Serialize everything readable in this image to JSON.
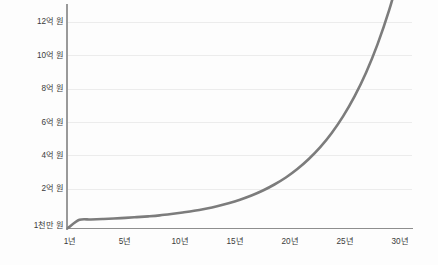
{
  "chart_data": {
    "type": "line",
    "title": "",
    "subtitle": "",
    "xlabel": "",
    "ylabel": "",
    "grid": true,
    "legend": false,
    "legend_position": "none",
    "line_color": "#7c7c7c",
    "gridline_color": "#ececec",
    "axis_color": "#8e8e8e",
    "background_color": "#fdfdfd",
    "x_tick_labels": [
      "1년",
      "5년",
      "10년",
      "15년",
      "20년",
      "25년",
      "30년"
    ],
    "x_tick_values": [
      1,
      5,
      10,
      15,
      20,
      25,
      30
    ],
    "xlim": [
      1,
      31
    ],
    "y_tick_labels": [
      "1천만 원",
      "2억 원",
      "4억 원",
      "6억 원",
      "8억 원",
      "10억 원",
      "12억 원"
    ],
    "y_tick_values": [
      0.1,
      2,
      4,
      6,
      8,
      10,
      12
    ],
    "y_unit": "억 원",
    "ylim": [
      0.1,
      13
    ],
    "series": [
      {
        "name": "복리 성장",
        "x": [
          1,
          2,
          3,
          4,
          5,
          6,
          7,
          8,
          9,
          10,
          11,
          12,
          13,
          14,
          15,
          16,
          17,
          18,
          19,
          20,
          21,
          22,
          23,
          24,
          25,
          26,
          27,
          28,
          29,
          30
        ],
        "values": [
          0.1,
          0.12,
          0.14,
          0.17,
          0.2,
          0.24,
          0.28,
          0.33,
          0.39,
          0.47,
          0.56,
          0.66,
          0.79,
          0.94,
          1.12,
          1.33,
          1.58,
          1.88,
          2.24,
          2.66,
          3.17,
          3.77,
          4.48,
          5.33,
          6.34,
          7.54,
          8.96,
          10.66,
          12.68,
          15.08
        ]
      }
    ]
  },
  "chart": {
    "curve_path": "M 68 228 L 79 227.6 L 90 227.1 L 101 226.4 L 112 225.6 L 123 224.6 L 134 223.4 L 145 221.9 L 156 220.2 L 167 218.0 L 178 215.4 L 189 212.4 L 200 208.7 L 211 204.4 L 222 199.2 L 233 193.1 L 244 185.9 L 255 177.4 L 266 167.4 L 277 155.7 L 288 142.0 L 299 126.1 L 310 107.6 L 321 86.2 L 332 61.5 L 343 33.0",
    "curve_path_render": "M 68 228 C 110 227.5 160 224 200 212 C 240 199 280 176 310 142 C 340 108 375 72 412 60",
    "grid_y_positions": [
      21.8,
      55.2,
      88.5,
      121.8,
      155.2,
      188.5
    ],
    "x_tick_positions": [
      70,
      125,
      180,
      235,
      290,
      345,
      400
    ],
    "y_label_positions": [
      18,
      51.5,
      85,
      118.5,
      152,
      185,
      222
    ]
  }
}
